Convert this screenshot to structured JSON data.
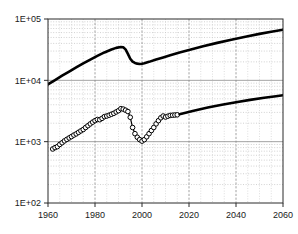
{
  "chart_data": {
    "type": "line",
    "title": "",
    "subtitle": "",
    "xlabel": "",
    "ylabel": "",
    "yscale": "log",
    "xscale": "linear",
    "xlim": [
      1960,
      2060
    ],
    "ylim": [
      100,
      100000
    ],
    "grid": true,
    "minor_grid": true,
    "legend": "none",
    "x_ticks": [
      "1960",
      "1980",
      "2000",
      "2020",
      "2040",
      "2060"
    ],
    "x_tick_values": [
      1960,
      1980,
      2000,
      2020,
      2040,
      2060
    ],
    "y_ticks": [
      "1E+02",
      "1E+03",
      "1E+04",
      "1E+05"
    ],
    "y_tick_values": [
      100,
      1000,
      10000,
      100000
    ],
    "series": [
      {
        "name": "upper-curve",
        "style": "solid-thick",
        "color": "#000000",
        "marker": "none",
        "x": [
          1960,
          1963,
          1966,
          1969,
          1972,
          1975,
          1978,
          1981,
          1984,
          1987,
          1989,
          1991,
          1992,
          1993,
          1994,
          1995,
          1996,
          1997,
          1998,
          1999,
          2000,
          2001,
          2003,
          2006,
          2009,
          2012,
          2016,
          2020,
          2026,
          2032,
          2038,
          2044,
          2050,
          2055,
          2060
        ],
        "y": [
          8600,
          10100,
          11900,
          13900,
          16200,
          18900,
          21800,
          25000,
          28500,
          31800,
          33800,
          35000,
          34600,
          32000,
          27000,
          22500,
          20200,
          19200,
          18700,
          18500,
          18600,
          19000,
          20000,
          21800,
          23600,
          25600,
          28400,
          31200,
          35800,
          40800,
          46000,
          51400,
          57200,
          62000,
          67000
        ]
      },
      {
        "name": "lower-observed",
        "style": "solid-thin-with-markers",
        "color": "#000000",
        "marker": "open-circle",
        "x": [
          1962,
          1963,
          1964,
          1965,
          1966,
          1967,
          1968,
          1969,
          1970,
          1971,
          1972,
          1973,
          1974,
          1975,
          1976,
          1977,
          1978,
          1979,
          1980,
          1981,
          1982,
          1983,
          1984,
          1985,
          1986,
          1987,
          1988,
          1989,
          1990,
          1991,
          1992,
          1993,
          1994,
          1995,
          1996,
          1997,
          1998,
          1999,
          2000,
          2001,
          2002,
          2003,
          2004,
          2005,
          2006,
          2007,
          2008,
          2009,
          2010,
          2011,
          2012,
          2013,
          2014,
          2015
        ],
        "y": [
          760,
          800,
          830,
          900,
          960,
          1030,
          1090,
          1150,
          1210,
          1280,
          1340,
          1420,
          1500,
          1580,
          1700,
          1820,
          1950,
          2080,
          2200,
          2300,
          2280,
          2400,
          2560,
          2620,
          2700,
          2800,
          2900,
          3050,
          3200,
          3450,
          3400,
          3260,
          3100,
          2500,
          1700,
          1350,
          1180,
          1080,
          1020,
          1080,
          1200,
          1350,
          1520,
          1700,
          1950,
          2200,
          2450,
          2620,
          2520,
          2600,
          2680,
          2700,
          2720,
          2740
        ]
      },
      {
        "name": "lower-projection",
        "style": "solid-thick",
        "color": "#000000",
        "marker": "none",
        "x": [
          2016,
          2022,
          2028,
          2034,
          2040,
          2046,
          2052,
          2057,
          2060
        ],
        "y": [
          2800,
          3200,
          3600,
          4000,
          4400,
          4800,
          5200,
          5500,
          5700
        ]
      }
    ]
  },
  "axes": {
    "y_axis_name": "y-axis",
    "x_axis_name": "x-axis"
  }
}
